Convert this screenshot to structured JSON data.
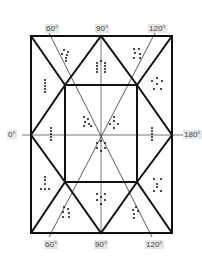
{
  "labels": {
    "top_60": "60°",
    "top_90": "90°",
    "top_120": "120°",
    "bottom_60": "60°",
    "bottom_90": "90°",
    "bottom_120": "120°",
    "left_0": "0°",
    "right_180": "180°"
  },
  "colors": {
    "line": "#111111",
    "thin_line": "#333333",
    "axis": "#777777",
    "dot": "#111111",
    "label_bg": "#e6e6e6"
  },
  "geometry": {
    "outer_rect": [
      31,
      36,
      172,
      233
    ],
    "inner_rect": [
      65,
      85,
      137,
      182
    ],
    "center": [
      101,
      135
    ]
  }
}
